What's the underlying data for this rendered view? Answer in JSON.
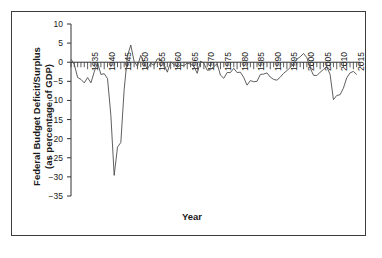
{
  "figure": {
    "background_color": "#ffffff",
    "border_color": "#3c3c3c",
    "line_color": "#4d4d4d",
    "axis_color": "#333333"
  },
  "chart_data": {
    "type": "line",
    "title": "",
    "xlabel": "Year",
    "ylabel": "Federal Budget Deficit/Surplus\n(as percentage of GDP)",
    "xlim": [
      1930,
      2017
    ],
    "ylim": [
      -35,
      10
    ],
    "grid": false,
    "legend": "none",
    "y_ticks": [
      10,
      5,
      0,
      -5,
      -10,
      -15,
      -20,
      -25,
      -30,
      -35
    ],
    "y_tick_labels": [
      "10",
      "5",
      "0",
      "−5",
      "−10",
      "−15",
      "−20",
      "−25",
      "−30",
      "−35"
    ],
    "x_ticks": [
      1935,
      1940,
      1945,
      1950,
      1955,
      1960,
      1965,
      1970,
      1975,
      1980,
      1985,
      1990,
      1995,
      2000,
      2005,
      2010,
      2015
    ],
    "x_tick_labels": [
      "1935",
      "1940",
      "1945",
      "1950",
      "1955",
      "1960",
      "1965",
      "1970",
      "1975",
      "1980",
      "1985",
      "1990",
      "1995",
      "2000",
      "2005",
      "2010",
      "2015"
    ],
    "x_minor_tick_interval": 1,
    "zero_reference_line": 0,
    "series": [
      {
        "name": "Federal Budget Deficit/Surplus",
        "x": [
          1930,
          1931,
          1932,
          1933,
          1934,
          1935,
          1936,
          1937,
          1938,
          1939,
          1940,
          1941,
          1942,
          1943,
          1944,
          1945,
          1946,
          1947,
          1948,
          1949,
          1950,
          1951,
          1952,
          1953,
          1954,
          1955,
          1956,
          1957,
          1958,
          1959,
          1960,
          1961,
          1962,
          1963,
          1964,
          1965,
          1966,
          1967,
          1968,
          1969,
          1970,
          1971,
          1972,
          1973,
          1974,
          1975,
          1976,
          1977,
          1978,
          1979,
          1980,
          1981,
          1982,
          1983,
          1984,
          1985,
          1986,
          1987,
          1988,
          1989,
          1990,
          1991,
          1992,
          1993,
          1994,
          1995,
          1996,
          1997,
          1998,
          1999,
          2000,
          2001,
          2002,
          2003,
          2004,
          2005,
          2006,
          2007,
          2008,
          2009,
          2010,
          2011,
          2012,
          2013,
          2014,
          2015,
          2016
        ],
        "y": [
          0.8,
          -0.6,
          -4.0,
          -4.5,
          -5.4,
          -4.0,
          -5.4,
          -2.5,
          -0.1,
          -3.2,
          -3.0,
          -4.3,
          -13.9,
          -29.6,
          -22.2,
          -21.0,
          -7.2,
          1.7,
          4.5,
          0.2,
          -1.1,
          1.8,
          -0.4,
          -1.7,
          -0.3,
          -0.8,
          0.9,
          0.7,
          -0.6,
          -2.6,
          0.1,
          -0.6,
          -1.3,
          -0.8,
          -0.9,
          -0.2,
          -0.5,
          -1.1,
          -2.9,
          0.3,
          -0.3,
          -2.1,
          -2.0,
          -1.1,
          -0.4,
          -3.4,
          -4.2,
          -2.7,
          -2.7,
          -1.6,
          -2.7,
          -2.6,
          -4.0,
          -6.0,
          -4.8,
          -5.1,
          -5.0,
          -3.2,
          -3.1,
          -2.8,
          -3.9,
          -4.5,
          -4.7,
          -3.9,
          -2.9,
          -2.2,
          -1.4,
          -0.3,
          0.8,
          1.4,
          2.3,
          1.2,
          -1.5,
          -3.4,
          -3.5,
          -2.6,
          -1.9,
          -1.2,
          -3.2,
          -9.8,
          -8.7,
          -8.5,
          -6.8,
          -4.1,
          -2.8,
          -2.4,
          -3.2
        ]
      }
    ]
  },
  "axis_labels": {
    "yaxis_title": "Federal Budget Deficit/Surplus\n(as percentage of GDP)",
    "xaxis_title": "Year"
  }
}
